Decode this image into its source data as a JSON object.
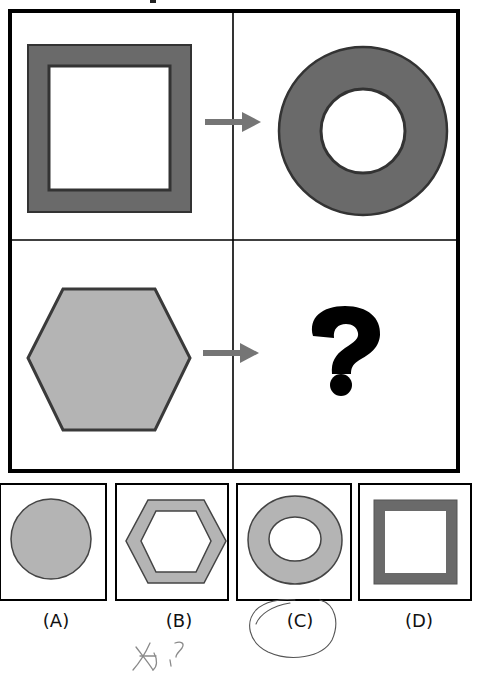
{
  "puzzle": {
    "type": "analogy-matrix",
    "grid": {
      "rows": 2,
      "cols": 2,
      "cells": [
        {
          "position": "top-left",
          "shape": "square-frame",
          "fill": "dark-gray"
        },
        {
          "position": "top-right",
          "shape": "ring",
          "fill": "dark-gray"
        },
        {
          "position": "bottom-left",
          "shape": "hexagon",
          "fill": "light-gray"
        },
        {
          "position": "bottom-right",
          "shape": "question-mark",
          "text": "?"
        }
      ],
      "arrows": [
        {
          "row": 1,
          "icon": "arrow-right-icon"
        },
        {
          "row": 2,
          "icon": "arrow-right-icon"
        }
      ]
    },
    "options": [
      {
        "label": "(A)",
        "shape": "circle",
        "fill": "light-gray"
      },
      {
        "label": "(B)",
        "shape": "hexagon-frame",
        "fill": "light-gray"
      },
      {
        "label": "(C)",
        "shape": "ring",
        "fill": "light-gray",
        "circled": true
      },
      {
        "label": "(D)",
        "shape": "square-frame",
        "fill": "dark-gray"
      }
    ],
    "question_glyph": "?",
    "handwritten_note": "知?"
  },
  "colors": {
    "dark_fill": "#6a6a6a",
    "light_fill": "#b4b4b4",
    "stroke": "#333333",
    "border": "#000000",
    "arrow": "#757575",
    "pencil": "#555555",
    "background": "#ffffff"
  }
}
